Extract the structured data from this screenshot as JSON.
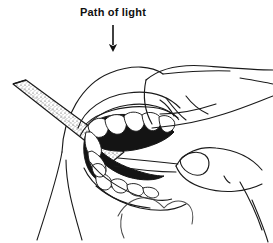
{
  "figure": {
    "domain": "Diagram",
    "background_color": "#ffffff",
    "ink_color": "#1a1a1a",
    "width": 273,
    "height": 243,
    "style": "black-and-white pen-and-ink line drawing with stipple shading"
  },
  "annotation": {
    "label": "Path of light",
    "label_color": "#111111",
    "label_x": 113,
    "label_y": 14,
    "arrow": {
      "name": "path-of-light-arrow",
      "direction": "down",
      "color": "#111111",
      "shaft_from_x": 113,
      "shaft_from_y": 25,
      "shaft_to_x": 113,
      "shaft_to_y": 45,
      "head_tip_x": 113,
      "head_tip_y": 54
    }
  },
  "scene": {
    "description": "A clinician's hand retracts a patient's lip and cheek to expose the teeth while a flat dental instrument enters the mouth from the lower left.",
    "elements": [
      {
        "name": "dental-instrument",
        "label": "Flat stippled dental mirror / retractor blade",
        "enters_from": "left",
        "tip_x": 13,
        "tip_y": 84,
        "end_x": 120,
        "end_y": 160,
        "shading": "stipple"
      },
      {
        "name": "patient-face",
        "label": "Patient cheek, lip and chin contours",
        "outline_color": "#1a1a1a"
      },
      {
        "name": "upper-lip",
        "label": "Retracted upper lip"
      },
      {
        "name": "lower-lip",
        "label": "Lower lip and chin"
      },
      {
        "name": "oral-cavity",
        "label": "Dark interior of the open mouth",
        "fill_color": "#141414"
      },
      {
        "name": "upper-teeth-arch",
        "label": "Upper arch of teeth",
        "tooth_count": 7,
        "fill_color": "#ffffff"
      },
      {
        "name": "lower-teeth-arch",
        "label": "Lower arch of teeth",
        "tooth_count": 6,
        "fill_color": "#ffffff"
      },
      {
        "name": "clinician-hand",
        "label": "Clinician's hand with index, middle and ring fingers retracting the cheek"
      },
      {
        "name": "clinician-thumb",
        "label": "Clinician's thumb with fingernail resting below the mouth"
      },
      {
        "name": "neck-contour",
        "label": "Patient neck and jawline"
      }
    ]
  }
}
